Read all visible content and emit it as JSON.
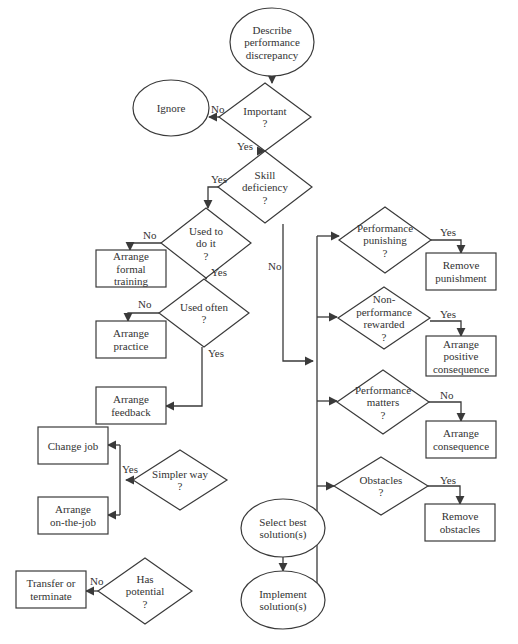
{
  "colors": {
    "stroke": "#3a3a3a",
    "text": "#333333",
    "background": "#ffffff"
  },
  "nodes": [
    {
      "id": "describe",
      "type": "oval",
      "cx": 272,
      "cy": 42,
      "rx": 42,
      "ry": 34,
      "lines": [
        "Describe",
        "performance",
        "discrepancy"
      ]
    },
    {
      "id": "important",
      "type": "diamond",
      "cx": 265,
      "cy": 117,
      "hw": 46,
      "hh": 34,
      "lines": [
        "Important",
        "?"
      ]
    },
    {
      "id": "ignore",
      "type": "oval",
      "cx": 171,
      "cy": 108,
      "rx": 38,
      "ry": 28,
      "lines": [
        "Ignore"
      ]
    },
    {
      "id": "skill",
      "type": "diamond",
      "cx": 265,
      "cy": 187,
      "hw": 47,
      "hh": 36,
      "lines": [
        "Skill",
        "deficiency",
        "?"
      ]
    },
    {
      "id": "used_to",
      "type": "diamond",
      "cx": 206,
      "cy": 243,
      "hw": 45,
      "hh": 35,
      "lines": [
        "Used to",
        "do it",
        "?"
      ]
    },
    {
      "id": "formal_training",
      "type": "rect",
      "x": 96,
      "y": 250,
      "w": 70,
      "h": 37,
      "lines": [
        "Arrange",
        "formal",
        "training"
      ]
    },
    {
      "id": "used_often",
      "type": "diamond",
      "cx": 204,
      "cy": 313,
      "hw": 45,
      "hh": 34,
      "lines": [
        "Used often",
        "?"
      ]
    },
    {
      "id": "practice",
      "type": "rect",
      "x": 96,
      "y": 321,
      "w": 70,
      "h": 37,
      "lines": [
        "Arrange",
        "practice"
      ]
    },
    {
      "id": "feedback",
      "type": "rect",
      "x": 96,
      "y": 387,
      "w": 70,
      "h": 37,
      "lines": [
        "Arrange",
        "feedback"
      ]
    },
    {
      "id": "change_job",
      "type": "rect",
      "x": 38,
      "y": 427,
      "w": 70,
      "h": 37,
      "lines": [
        "Change job"
      ]
    },
    {
      "id": "simpler_way",
      "type": "diamond",
      "cx": 180,
      "cy": 480,
      "hw": 47,
      "hh": 30,
      "lines": [
        "Simpler way",
        "?"
      ]
    },
    {
      "id": "on_the_job",
      "type": "rect",
      "x": 38,
      "y": 497,
      "w": 70,
      "h": 37,
      "lines": [
        "Arrange",
        "on-the-job"
      ]
    },
    {
      "id": "transfer",
      "type": "rect",
      "x": 16,
      "y": 571,
      "w": 70,
      "h": 37,
      "lines": [
        "Transfer or",
        "terminate"
      ]
    },
    {
      "id": "has_potential",
      "type": "diamond",
      "cx": 145,
      "cy": 591,
      "hw": 47,
      "hh": 33,
      "lines": [
        "Has",
        "potential",
        "?"
      ]
    },
    {
      "id": "perf_punishing",
      "type": "diamond",
      "cx": 385,
      "cy": 240,
      "hw": 46,
      "hh": 33,
      "lines": [
        "Performance",
        "punishing",
        "?"
      ]
    },
    {
      "id": "remove_punishment",
      "type": "rect",
      "x": 426,
      "y": 253,
      "w": 70,
      "h": 37,
      "lines": [
        "Remove",
        "punishment"
      ]
    },
    {
      "id": "nonperf_rewarded",
      "type": "diamond",
      "cx": 384,
      "cy": 318,
      "hw": 46,
      "hh": 31,
      "lines": [
        "Non-",
        "performance",
        "rewarded",
        "?"
      ]
    },
    {
      "id": "positive_consequence",
      "type": "rect",
      "x": 426,
      "y": 336,
      "w": 70,
      "h": 40,
      "lines": [
        "Arrange",
        "positive",
        "consequence"
      ]
    },
    {
      "id": "perf_matters",
      "type": "diamond",
      "cx": 383,
      "cy": 402,
      "hw": 46,
      "hh": 32,
      "lines": [
        "Performance",
        "matters",
        "?"
      ]
    },
    {
      "id": "arrange_consequence",
      "type": "rect",
      "x": 426,
      "y": 421,
      "w": 70,
      "h": 37,
      "lines": [
        "Arrange",
        "consequence"
      ]
    },
    {
      "id": "obstacles",
      "type": "diamond",
      "cx": 381,
      "cy": 486,
      "hw": 47,
      "hh": 29,
      "lines": [
        "Obstacles",
        "?"
      ]
    },
    {
      "id": "remove_obstacles",
      "type": "rect",
      "x": 425,
      "y": 504,
      "w": 70,
      "h": 37,
      "lines": [
        "Remove",
        "obstacles"
      ]
    },
    {
      "id": "select_best",
      "type": "oval",
      "cx": 283,
      "cy": 528,
      "rx": 42,
      "ry": 29,
      "lines": [
        "Select best",
        "solution(s)"
      ]
    },
    {
      "id": "implement",
      "type": "oval",
      "cx": 283,
      "cy": 600,
      "rx": 42,
      "ry": 29,
      "lines": [
        "Implement",
        "solution(s)"
      ]
    }
  ],
  "edges": [
    {
      "id": "describe-important",
      "points": [
        [
          272,
          76
        ],
        [
          272,
          83
        ]
      ]
    },
    {
      "id": "important-ignore",
      "points": [
        [
          219,
          117
        ],
        [
          209,
          117
        ]
      ],
      "label": "No",
      "lx": 211,
      "ly": 113
    },
    {
      "id": "important-skill",
      "points": [
        [
          265,
          151
        ],
        [
          265,
          151
        ]
      ],
      "label": "Yes",
      "lx": 237,
      "ly": 150
    },
    {
      "id": "skill-usedto",
      "points": [
        [
          218,
          187
        ],
        [
          208,
          187
        ],
        [
          208,
          208
        ]
      ],
      "label": "Yes",
      "lx": 211,
      "ly": 183
    },
    {
      "id": "usedto-formal",
      "points": [
        [
          161,
          243
        ],
        [
          130,
          243
        ],
        [
          130,
          250
        ]
      ],
      "label": "No",
      "lx": 143,
      "ly": 239
    },
    {
      "id": "usedto-usedoften",
      "points": [
        [
          206,
          278
        ],
        [
          206,
          279
        ]
      ],
      "label": "Yes",
      "lx": 211,
      "ly": 276
    },
    {
      "id": "usedoften-practice",
      "points": [
        [
          159,
          313
        ],
        [
          128,
          313
        ],
        [
          128,
          321
        ]
      ],
      "label": "No",
      "lx": 138,
      "ly": 308
    },
    {
      "id": "usedoften-feedback",
      "points": [
        [
          202,
          347
        ],
        [
          202,
          406
        ],
        [
          166,
          406
        ]
      ],
      "label": "Yes",
      "lx": 208,
      "ly": 357
    },
    {
      "id": "skill-no-trunk",
      "points": [
        [
          283,
          224
        ],
        [
          283,
          361
        ],
        [
          313,
          361
        ]
      ],
      "label": "No",
      "lx": 268,
      "ly": 270
    },
    {
      "id": "trunk-vertical",
      "points": [
        [
          317,
          236
        ],
        [
          317,
          583
        ]
      ],
      "arrow": false
    },
    {
      "id": "trunk-punishing",
      "points": [
        [
          317,
          236
        ],
        [
          339,
          236
        ]
      ]
    },
    {
      "id": "trunk-rewarded",
      "points": [
        [
          317,
          317
        ],
        [
          337,
          317
        ]
      ]
    },
    {
      "id": "trunk-matters",
      "points": [
        [
          317,
          401
        ],
        [
          337,
          401
        ]
      ]
    },
    {
      "id": "trunk-obstacles",
      "points": [
        [
          317,
          486
        ],
        [
          334,
          486
        ]
      ]
    },
    {
      "id": "punishing-remove",
      "points": [
        [
          431,
          240
        ],
        [
          461,
          240
        ],
        [
          461,
          253
        ]
      ],
      "label": "Yes",
      "lx": 440,
      "ly": 236
    },
    {
      "id": "rewarded-positive",
      "points": [
        [
          430,
          321
        ],
        [
          461,
          321
        ],
        [
          461,
          336
        ]
      ],
      "label": "Yes",
      "lx": 440,
      "ly": 318
    },
    {
      "id": "matters-consequence",
      "points": [
        [
          429,
          402
        ],
        [
          461,
          402
        ],
        [
          461,
          421
        ]
      ],
      "label": "No",
      "lx": 440,
      "ly": 399
    },
    {
      "id": "obstacles-remove",
      "points": [
        [
          428,
          486
        ],
        [
          460,
          486
        ],
        [
          460,
          504
        ]
      ],
      "label": "Yes",
      "lx": 440,
      "ly": 484
    },
    {
      "id": "select-implement",
      "points": [
        [
          283,
          557
        ],
        [
          283,
          571
        ]
      ]
    },
    {
      "id": "simpler-branch",
      "points": [
        [
          133,
          480
        ],
        [
          126,
          480
        ]
      ],
      "label": "Yes",
      "lx": 122,
      "ly": 473
    },
    {
      "id": "simpler-vertical",
      "points": [
        [
          120,
          445
        ],
        [
          120,
          515
        ]
      ],
      "arrow": false
    },
    {
      "id": "simpler-changejob",
      "points": [
        [
          120,
          445
        ],
        [
          108,
          445
        ]
      ]
    },
    {
      "id": "simpler-onthejob",
      "points": [
        [
          120,
          515
        ],
        [
          108,
          515
        ]
      ]
    },
    {
      "id": "potential-transfer",
      "points": [
        [
          98,
          591
        ],
        [
          86,
          591
        ]
      ],
      "label": "No",
      "lx": 90,
      "ly": 585
    }
  ]
}
